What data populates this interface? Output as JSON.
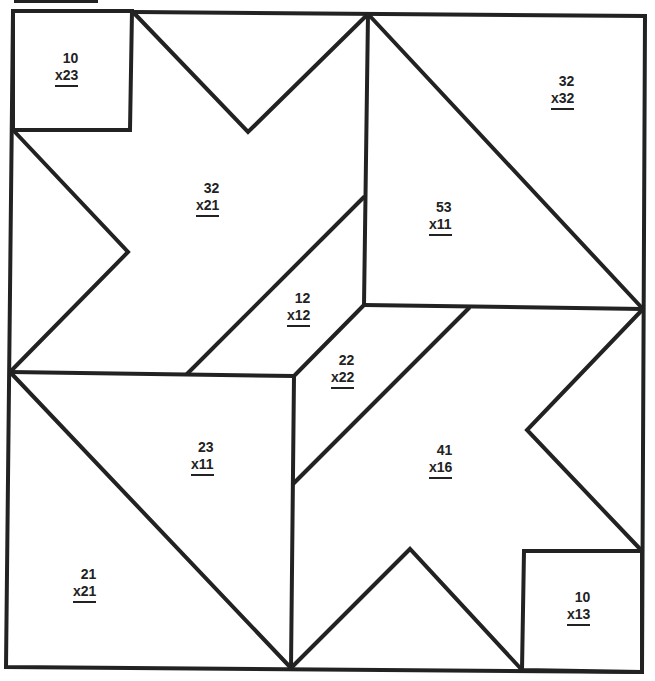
{
  "ink_color": "#222222",
  "paper_color": "#ffffff",
  "problems": [
    {
      "id": "top-left-square",
      "top": "10",
      "bottom": "x23"
    },
    {
      "id": "top-right-corner",
      "top": "32",
      "bottom": "x32"
    },
    {
      "id": "upper-left-star",
      "top": "32",
      "bottom": "x21"
    },
    {
      "id": "upper-right-triangle",
      "top": "53",
      "bottom": "x11"
    },
    {
      "id": "center-upper-strip",
      "top": "12",
      "bottom": "x12"
    },
    {
      "id": "center-lower-strip",
      "top": "22",
      "bottom": "x22"
    },
    {
      "id": "lower-left-triangle",
      "top": "23",
      "bottom": "x11"
    },
    {
      "id": "lower-right-star",
      "top": "41",
      "bottom": "x16"
    },
    {
      "id": "bottom-left-corner",
      "top": "21",
      "bottom": "x21"
    },
    {
      "id": "bottom-right-square",
      "top": "10",
      "bottom": "x13"
    }
  ]
}
